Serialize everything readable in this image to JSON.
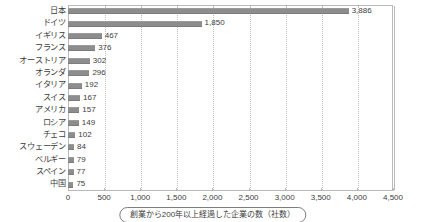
{
  "chart_data": {
    "type": "bar",
    "orientation": "horizontal",
    "title": "",
    "subtitle": "",
    "xlabel": "",
    "ylabel": "",
    "xlim": [
      0,
      4500
    ],
    "xticks": [
      0,
      500,
      1000,
      1500,
      2000,
      2500,
      3000,
      3500,
      4000,
      4500
    ],
    "xtick_labels": [
      "0",
      "500",
      "1,000",
      "1,500",
      "2,000",
      "2,500",
      "3,000",
      "3,500",
      "4,000",
      "4,500"
    ],
    "grid": true,
    "grid_axis": "x",
    "grid_style": "dotted",
    "legend": false,
    "categories": [
      "日本",
      "ドイツ",
      "イギリス",
      "フランス",
      "オーストリア",
      "オランダ",
      "イタリア",
      "スイス",
      "アメリカ",
      "ロシア",
      "チェコ",
      "スウェーデン",
      "ベルギー",
      "スペイン",
      "中国"
    ],
    "values": [
      3886,
      1850,
      467,
      376,
      302,
      296,
      192,
      167,
      157,
      149,
      102,
      84,
      79,
      77,
      75
    ],
    "value_labels": [
      "3,886",
      "1,850",
      "467",
      "376",
      "302",
      "296",
      "192",
      "167",
      "157",
      "149",
      "102",
      "84",
      "79",
      "77",
      "75"
    ],
    "bar_color": "#8d8d8d",
    "axis_color": "#b9b9b9",
    "text_color": "#3d3d3d",
    "annotations": [
      "創業から200年以上経過した企業の数（社数）"
    ]
  },
  "caption": {
    "text": "創業から200年以上経過した企業の数（社数）"
  }
}
